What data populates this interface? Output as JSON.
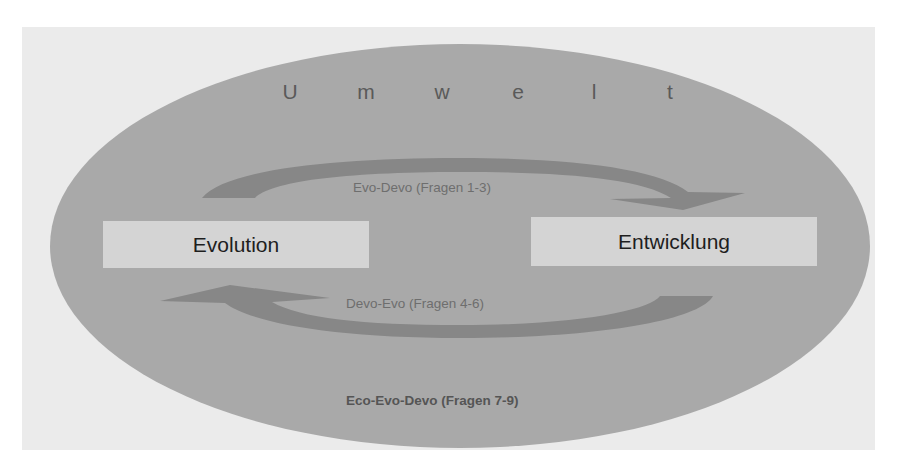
{
  "diagram": {
    "environment": {
      "label_letters": [
        "U",
        "m",
        "w",
        "e",
        "l",
        "t"
      ],
      "label": "Umwelt"
    },
    "nodes": {
      "left": "Evolution",
      "right": "Entwicklung"
    },
    "arrows": {
      "top": {
        "label": "Evo-Devo (Fragen 1-3)",
        "direction": "left-to-right"
      },
      "bottom": {
        "label": "Devo-Evo (Fragen 4-6)",
        "direction": "right-to-left"
      }
    },
    "footer_label": "Eco-Evo-Devo (Fragen 7-9)",
    "colors": {
      "panel": "#ebebeb",
      "ellipse": "#a9a9a9",
      "box": "#d4d4d4",
      "arrow": "#878787"
    }
  }
}
